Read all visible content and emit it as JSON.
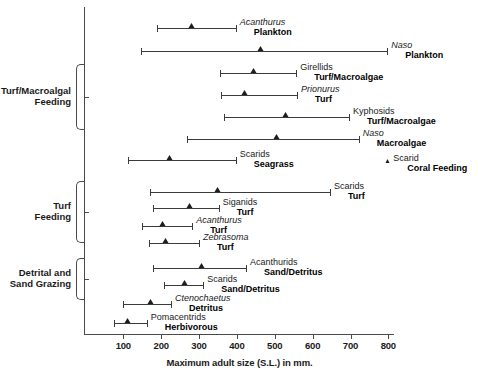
{
  "chart_data": {
    "type": "bar",
    "title": "",
    "xlabel": "Maximum adult size (S.L.) in mm.",
    "ylabel": "",
    "xlim": [
      61,
      860
    ],
    "ticks": [
      100,
      200,
      300,
      400,
      500,
      600,
      700,
      800
    ],
    "grid": false,
    "legend": "none",
    "units": "mm",
    "value_note": "Horizontal lines show minimum to maximum adult size range; triangle marks the modal/mean size.",
    "groups": [
      {
        "label": "Turf/Macroalgal Feeding",
        "label_line1": "Turf/Macroalgal",
        "label_line2": "Feeding",
        "rows": [
          2,
          3,
          4,
          5
        ]
      },
      {
        "label": "Turf Feeding",
        "label_line1": "Turf",
        "label_line2": "Feeding",
        "rows": [
          8,
          9,
          10,
          11
        ]
      },
      {
        "label": "Detrital and Sand Grazing",
        "label_line1": "Detrital and",
        "label_line2": "Sand Grazing",
        "rows": [
          12,
          13,
          14,
          15
        ]
      }
    ],
    "rows": [
      {
        "taxon": "Acanthurus",
        "italic": true,
        "diet": "Plankton",
        "min": 188,
        "max": 397,
        "marker": 281,
        "indent": true,
        "single": false
      },
      {
        "taxon": "Naso",
        "italic": true,
        "diet": "Plankton",
        "min": 147,
        "max": 797,
        "marker": 463,
        "indent": true,
        "single": false
      },
      {
        "taxon": "Girellids",
        "italic": false,
        "diet": "Turf/Macroalgae",
        "min": 356,
        "max": 557,
        "marker": 445,
        "indent": true,
        "single": false
      },
      {
        "taxon": "Prionurus",
        "italic": true,
        "diet": "Turf",
        "min": 359,
        "max": 559,
        "marker": 420,
        "indent": true,
        "single": false
      },
      {
        "taxon": "Kyphosids",
        "italic": false,
        "diet": "Turf/Macroalgae",
        "min": 365,
        "max": 696,
        "marker": 530,
        "indent": true,
        "single": false
      },
      {
        "taxon": "Naso",
        "italic": true,
        "diet": "Macroalgae",
        "min": 269,
        "max": 722,
        "marker": 505,
        "indent": true,
        "single": false
      },
      {
        "taxon": "Scarids",
        "italic": false,
        "diet": "Seagrass",
        "min": 113,
        "max": 397,
        "marker": 223,
        "indent": true,
        "single": false
      },
      {
        "taxon": "Scarid",
        "italic": false,
        "diet": "Coral Feeding",
        "min": 800,
        "max": 800,
        "marker": 800,
        "indent": true,
        "single": true
      },
      {
        "taxon": "Scarids",
        "italic": false,
        "diet": "Turf",
        "min": 171,
        "max": 646,
        "marker": 351,
        "indent": true,
        "single": false
      },
      {
        "taxon": "Siganids",
        "italic": false,
        "diet": "Turf",
        "min": 177,
        "max": 352,
        "marker": 276,
        "indent": true,
        "single": false
      },
      {
        "taxon": "Acanthurus",
        "italic": true,
        "diet": "Turf",
        "min": 150,
        "max": 282,
        "marker": 204,
        "indent": true,
        "single": false
      },
      {
        "taxon": "Zebrasoma",
        "italic": true,
        "diet": "Turf",
        "min": 168,
        "max": 300,
        "marker": 212,
        "indent": true,
        "single": false
      },
      {
        "taxon": "Acanthurids",
        "italic": false,
        "diet": "Sand/Detritus",
        "min": 178,
        "max": 424,
        "marker": 308,
        "indent": true,
        "single": false
      },
      {
        "taxon": "Scarids",
        "italic": false,
        "diet": "Sand/Detritus",
        "min": 207,
        "max": 311,
        "marker": 263,
        "indent": true,
        "single": false
      },
      {
        "taxon": "Ctenochaetus",
        "italic": true,
        "diet": "Detritus",
        "min": 100,
        "max": 226,
        "marker": 172,
        "indent": true,
        "single": false
      },
      {
        "taxon": "Pomacentrids",
        "italic": false,
        "diet": "Herbivorous",
        "min": 74,
        "max": 162,
        "marker": 113,
        "indent": true,
        "single": false
      }
    ]
  }
}
